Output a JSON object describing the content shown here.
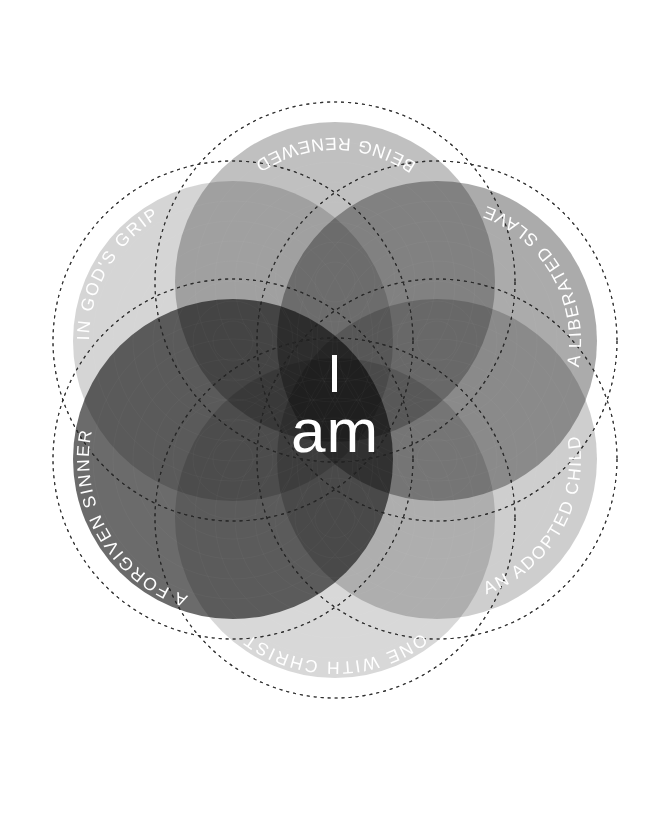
{
  "canvas": {
    "width": 670,
    "height": 813,
    "background": "#ffffff"
  },
  "center": {
    "line1": "I",
    "line2": "am",
    "text_color": "#ffffff"
  },
  "diagram": {
    "type": "venn-radial",
    "circle_count": 6,
    "center_x": 335,
    "center_y": 400,
    "orbit_radius": 118,
    "fill_radius": 160,
    "dash_radius": 180,
    "dash_color": "#2a2a2a",
    "label_color": "#ffffff"
  },
  "chart_data": {
    "type": "pie",
    "title": "I am",
    "xlabel": "",
    "ylabel": "",
    "categories": [
      "BEING RENEWED",
      "A LIBERATED SLAVE",
      "AN ADOPTED CHILD",
      "ONE WITH CHRIST",
      "A FORGIVEN SINNER",
      "IN GOD'S GRIP"
    ],
    "values": [
      1,
      1,
      1,
      1,
      1,
      1
    ],
    "legend_position": "on-arc",
    "grid": false
  },
  "circles": [
    {
      "id": "being-renewed",
      "label": "BEING RENEWED",
      "color": "#a8a8a8",
      "opacity": 0.72,
      "angle_deg": -90,
      "cx": 335,
      "cy": 282,
      "label_flip": true
    },
    {
      "id": "a-liberated-slave",
      "label": "A LIBERATED SLAVE",
      "color": "#8a8a8a",
      "opacity": 0.72,
      "angle_deg": -30,
      "cx": 437,
      "cy": 341,
      "label_flip": true
    },
    {
      "id": "an-adopted-child",
      "label": "AN ADOPTED CHILD",
      "color": "#c0c0c0",
      "opacity": 0.78,
      "angle_deg": 30,
      "cx": 437,
      "cy": 459,
      "label_flip": true
    },
    {
      "id": "one-with-christ",
      "label": "ONE WITH CHRIST",
      "color": "#cdcdcd",
      "opacity": 0.78,
      "angle_deg": 90,
      "cx": 335,
      "cy": 518,
      "label_flip": false
    },
    {
      "id": "a-forgiven-sinner",
      "label": "A FORGIVEN SINNER",
      "color": "#4a4a4a",
      "opacity": 0.82,
      "angle_deg": 150,
      "cx": 233,
      "cy": 459,
      "label_flip": false
    },
    {
      "id": "in-gods-grip",
      "label": "IN GOD'S GRIP",
      "color": "#c9c9c9",
      "opacity": 0.78,
      "angle_deg": -150,
      "cx": 233,
      "cy": 341,
      "label_flip": false
    }
  ]
}
